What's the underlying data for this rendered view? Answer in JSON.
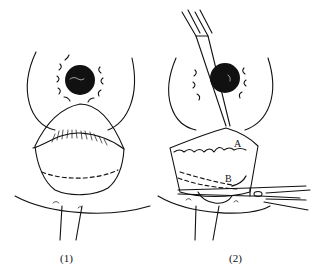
{
  "figure": {
    "panels": [
      {
        "id": "panel-1",
        "label": "(1)"
      },
      {
        "id": "panel-2",
        "label": "(2)",
        "marks": {
          "a": "A",
          "b": "B"
        }
      }
    ],
    "colors": {
      "line": "#111111",
      "background": "#ffffff"
    }
  }
}
